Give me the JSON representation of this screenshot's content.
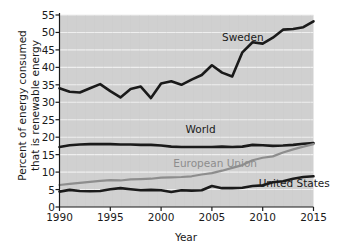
{
  "chart_data": {
    "type": "line",
    "title": "",
    "xlabel": "Year",
    "ylabel": "Percent of energy consumed\nthat is renewable energy",
    "xlim": [
      1990,
      2015
    ],
    "ylim": [
      0,
      55
    ],
    "xticks": [
      1990,
      1995,
      2000,
      2005,
      2010,
      2015
    ],
    "yticks": [
      0,
      5,
      10,
      15,
      20,
      25,
      30,
      35,
      40,
      45,
      50,
      55
    ],
    "grid": "horizontal",
    "legend": "inline-labels",
    "plot_background": "#d0d0d0",
    "gridline_color": "#efefef",
    "x": [
      1990,
      1991,
      1992,
      1993,
      1994,
      1995,
      1996,
      1997,
      1998,
      1999,
      2000,
      2001,
      2002,
      2003,
      2004,
      2005,
      2006,
      2007,
      2008,
      2009,
      2010,
      2011,
      2012,
      2013,
      2014,
      2015
    ],
    "series": [
      {
        "name": "Sweden",
        "color": "#1a1a1a",
        "width": 2.6,
        "label_x": 2006.0,
        "label_y": 48.5,
        "values": [
          34.0,
          33.0,
          32.8,
          34.0,
          35.2,
          33.2,
          31.4,
          33.8,
          34.5,
          31.2,
          35.4,
          36.0,
          35.0,
          36.5,
          37.8,
          40.6,
          38.5,
          37.4,
          44.3,
          47.2,
          46.8,
          48.5,
          50.8,
          51.0,
          51.5,
          53.2
        ]
      },
      {
        "name": "World",
        "color": "#1a1a1a",
        "width": 2.6,
        "label_x": 2002.4,
        "label_y": 22.0,
        "values": [
          17.2,
          17.7,
          17.9,
          18.0,
          18.0,
          18.0,
          17.9,
          17.9,
          17.8,
          17.8,
          17.6,
          17.3,
          17.2,
          17.2,
          17.2,
          17.2,
          17.3,
          17.2,
          17.3,
          17.8,
          17.7,
          17.5,
          17.6,
          17.8,
          18.1,
          18.3
        ]
      },
      {
        "name": "European Union",
        "color": "#8d8d8d",
        "width": 2.2,
        "label_x": 2001.2,
        "label_y": 12.2,
        "values": [
          6.3,
          6.6,
          6.9,
          7.2,
          7.5,
          7.7,
          7.6,
          7.9,
          8.0,
          8.1,
          8.4,
          8.5,
          8.6,
          8.8,
          9.3,
          9.7,
          10.4,
          11.2,
          12.0,
          13.4,
          14.1,
          14.5,
          15.6,
          16.5,
          17.3,
          18.0
        ]
      },
      {
        "name": "United States",
        "color": "#1a1a1a",
        "width": 2.6,
        "label_x": 2009.6,
        "label_y": 6.6,
        "values": [
          4.4,
          4.9,
          4.6,
          4.5,
          4.6,
          5.1,
          5.4,
          5.1,
          4.8,
          4.9,
          4.8,
          4.3,
          4.8,
          4.7,
          4.8,
          6.0,
          5.4,
          5.4,
          5.5,
          6.0,
          6.2,
          7.1,
          7.4,
          8.1,
          8.6,
          8.8
        ]
      }
    ]
  },
  "axis": {
    "x_tick_labels": [
      "1990",
      "1995",
      "2000",
      "2005",
      "2010",
      "2015"
    ],
    "y_tick_labels": [
      "0",
      "5",
      "10",
      "15",
      "20",
      "25",
      "30",
      "35",
      "40",
      "45",
      "50",
      "55"
    ],
    "x_axis_title": "Year",
    "y_axis_title_line1": "Percent of energy consumed",
    "y_axis_title_line2": "that is renewable energy"
  },
  "series_labels": {
    "sweden": "Sweden",
    "world": "World",
    "european_union": "European Union",
    "united_states": "United States"
  }
}
